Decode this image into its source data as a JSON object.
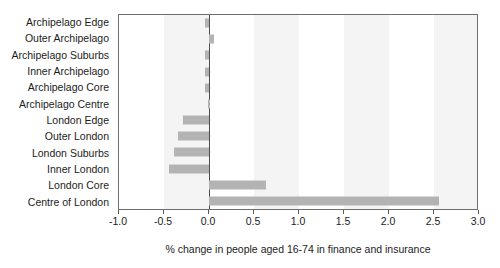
{
  "chart_data": {
    "type": "bar",
    "orientation": "horizontal",
    "title": "",
    "xlabel": "% change in people aged 16-74 in finance and insurance",
    "ylabel": "",
    "xlim": [
      -1.0,
      3.0
    ],
    "xticks": [
      "-1.0",
      "-0.5",
      "0.0",
      "0.5",
      "1.0",
      "1.5",
      "2.0",
      "2.5",
      "3.0"
    ],
    "xtick_values": [
      -1.0,
      -0.5,
      0.0,
      0.5,
      1.0,
      1.5,
      2.0,
      2.5,
      3.0
    ],
    "grid": false,
    "bands": true,
    "zero_line": true,
    "legend": "none",
    "bar_color": "#b3b3b3",
    "categories": [
      "Archipelago Edge",
      "Outer Archipelago",
      "Archipelago Suburbs",
      "Inner Archipelago",
      "Archipelago Core",
      "Archipelago Centre",
      "London Edge",
      "Outer London",
      "London Suburbs",
      "Inner London",
      "London Core",
      "Centre of London"
    ],
    "values": [
      -0.05,
      0.05,
      -0.05,
      -0.05,
      -0.05,
      -0.01,
      -0.29,
      -0.35,
      -0.39,
      -0.45,
      0.63,
      2.56
    ]
  }
}
